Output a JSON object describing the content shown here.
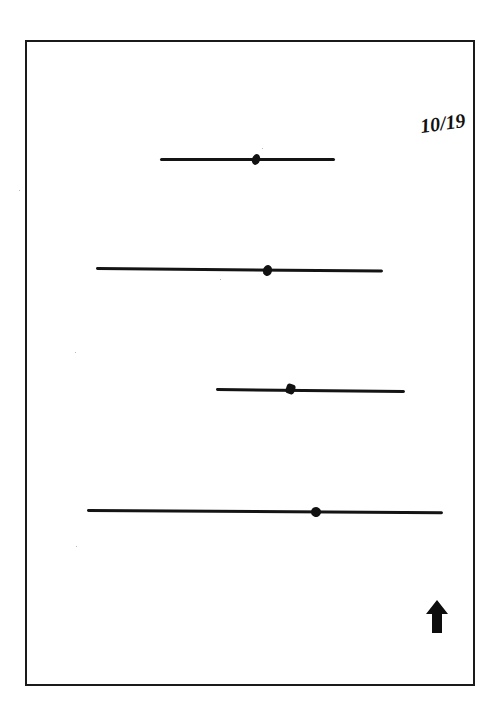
{
  "page": {
    "label": "10/19",
    "frame_color": "#1a1a1a",
    "ink_color": "#141414"
  },
  "stimuli": [
    {
      "index": 1,
      "x_start": 160,
      "x_end": 335,
      "y": 159,
      "mark_x": 256
    },
    {
      "index": 2,
      "x_start": 96,
      "x_end": 383,
      "y": 269,
      "mark_x": 267
    },
    {
      "index": 3,
      "x_start": 216,
      "x_end": 405,
      "y": 390,
      "mark_x": 290
    },
    {
      "index": 4,
      "x_start": 87,
      "x_end": 443,
      "y": 512,
      "mark_x": 315
    }
  ],
  "orientation_indicator": {
    "icon": "up-arrow-icon",
    "direction": "up"
  }
}
